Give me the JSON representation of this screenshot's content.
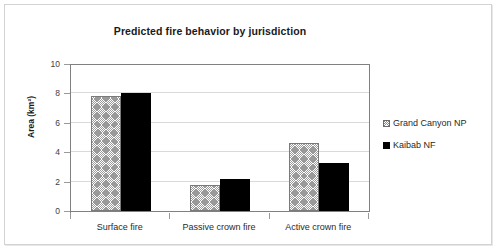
{
  "chart_data": {
    "type": "bar",
    "title": "Predicted fire behavior by jurisdiction",
    "xlabel": "",
    "ylabel": "Area (km²)",
    "categories": [
      "Surface fire",
      "Passive crown fire",
      "Active crown fire"
    ],
    "series": [
      {
        "name": "Grand Canyon NP",
        "values": [
          7.8,
          1.8,
          4.6
        ],
        "swatch": "hatched",
        "color": "#ffffff"
      },
      {
        "name": "Kaibab NF",
        "values": [
          8.0,
          2.2,
          3.3
        ],
        "swatch": "solid",
        "color": "#000000"
      }
    ],
    "ylim": [
      0,
      10
    ],
    "yticks": [
      0,
      2,
      4,
      6,
      8,
      10
    ],
    "ytick_labels": [
      "0",
      "2",
      "4",
      "6",
      "8",
      "10"
    ],
    "grid": true,
    "legend_position": "right"
  },
  "legend": {
    "entries": [
      {
        "label": "Grand Canyon NP"
      },
      {
        "label": "Kaibab NF"
      }
    ]
  }
}
